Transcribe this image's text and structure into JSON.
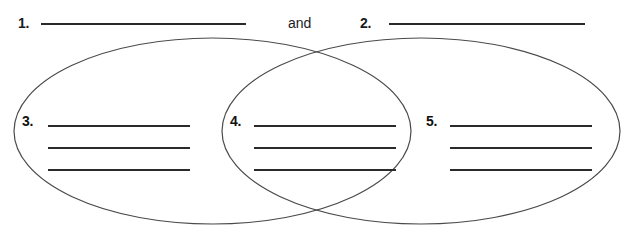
{
  "worksheet": {
    "type": "venn-diagram-two-set",
    "header": {
      "item1_number": "1.",
      "conjunction": "and",
      "item2_number": "2."
    },
    "regions": [
      {
        "number": "3.",
        "position": "left-only",
        "lines": 3
      },
      {
        "number": "4.",
        "position": "intersection",
        "lines": 3
      },
      {
        "number": "5.",
        "position": "right-only",
        "lines": 3
      }
    ],
    "blanks": {
      "title_left": "",
      "title_right": "",
      "left_line_1": "",
      "left_line_2": "",
      "left_line_3": "",
      "center_line_1": "",
      "center_line_2": "",
      "center_line_3": "",
      "right_line_1": "",
      "right_line_2": "",
      "right_line_3": ""
    },
    "colors": {
      "ink": "#2a2a2a",
      "outline": "#4a4a4a",
      "paper": "#ffffff"
    }
  }
}
